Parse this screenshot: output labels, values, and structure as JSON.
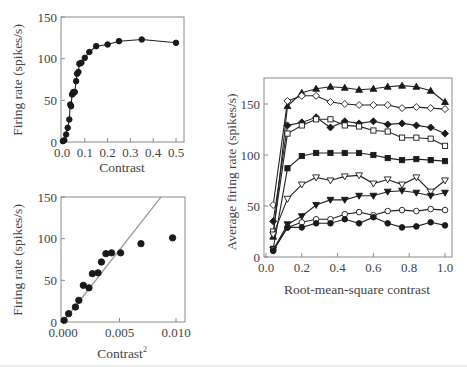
{
  "chart_data": [
    {
      "id": "top-left",
      "type": "line",
      "xlabel": "Contrast",
      "ylabel": "Firing rate (spikes/s)",
      "xlim": [
        0,
        0.53
      ],
      "ylim": [
        0,
        150
      ],
      "xticks": [
        0.0,
        0.1,
        0.2,
        0.3,
        0.4,
        0.5
      ],
      "xtick_labels": [
        "0.0",
        "0.1",
        "0.2",
        "0.3",
        "0.4",
        "0.5"
      ],
      "yticks": [
        0,
        50,
        100,
        150
      ],
      "ytick_labels": [
        "0",
        "50",
        "100",
        "150"
      ],
      "grid": false,
      "series": [
        {
          "name": "response",
          "marker": "filled-circle",
          "x": [
            0.004,
            0.01,
            0.018,
            0.025,
            0.032,
            0.036,
            0.04,
            0.044,
            0.048,
            0.05,
            0.056,
            0.062,
            0.066,
            0.072,
            0.076,
            0.085,
            0.1,
            0.12,
            0.15,
            0.2,
            0.25,
            0.35,
            0.5
          ],
          "y": [
            1,
            2,
            9,
            17,
            27,
            45,
            43,
            57,
            58,
            60,
            60,
            73,
            82,
            84,
            94,
            95,
            101,
            108,
            115,
            117,
            121,
            123,
            119
          ]
        }
      ]
    },
    {
      "id": "bottom-left",
      "type": "scatter",
      "xlabel": "Contrast",
      "xlabel_sup": "2",
      "ylabel": "Firing rate (spikes/s)",
      "xlim": [
        0,
        0.0105
      ],
      "ylim": [
        0,
        150
      ],
      "xticks": [
        0.0,
        0.005,
        0.01
      ],
      "xtick_labels": [
        "0.000",
        "0.005",
        "0.010"
      ],
      "yticks": [
        0,
        50,
        100,
        150
      ],
      "ytick_labels": [
        "0",
        "50",
        "100",
        "150"
      ],
      "grid": false,
      "series": [
        {
          "name": "response",
          "marker": "filled-circle",
          "x": [
            0.0001,
            0.0005,
            0.0011,
            0.0014,
            0.0018,
            0.0023,
            0.0026,
            0.0031,
            0.0034,
            0.0038,
            0.0043,
            0.0051,
            0.0069,
            0.0097
          ],
          "y": [
            2,
            10,
            18,
            26,
            44,
            41,
            58,
            59,
            72,
            82,
            83,
            83,
            94,
            101
          ]
        }
      ],
      "fit_line": {
        "name": "linear fit",
        "slope": 17300,
        "intercept": 0,
        "x_range": [
          0,
          0.00868
        ]
      }
    },
    {
      "id": "right",
      "type": "line",
      "xlabel": "Root-mean-square contrast",
      "ylabel": "Average firing rate (spikes/s)",
      "xlim": [
        0,
        1.02
      ],
      "ylim": [
        0,
        180
      ],
      "xticks": [
        0.0,
        0.2,
        0.4,
        0.6,
        0.8,
        1.0
      ],
      "xtick_labels": [
        "0.0",
        "0.2",
        "0.4",
        "0.6",
        "0.8",
        "1.0"
      ],
      "yticks": [
        0,
        50,
        100,
        150
      ],
      "ytick_labels": [
        "0",
        "50",
        "100",
        "150"
      ],
      "grid": false,
      "x": [
        0.04,
        0.12,
        0.2,
        0.28,
        0.36,
        0.44,
        0.52,
        0.6,
        0.68,
        0.76,
        0.84,
        0.92,
        1.0
      ],
      "series": [
        {
          "name": "filled-triangle-up",
          "marker": "triangle-up",
          "filled": true,
          "values": [
            20,
            148,
            161,
            165,
            167,
            166,
            164,
            165,
            167,
            168,
            167,
            163,
            152
          ]
        },
        {
          "name": "open-diamond",
          "marker": "diamond",
          "filled": false,
          "values": [
            51,
            153,
            158,
            158,
            152,
            150,
            149,
            149,
            149,
            146,
            147,
            146,
            145
          ]
        },
        {
          "name": "filled-diamond",
          "marker": "diamond",
          "filled": true,
          "values": [
            35,
            129,
            132,
            137,
            127,
            133,
            131,
            133,
            130,
            131,
            129,
            127,
            121
          ]
        },
        {
          "name": "open-square",
          "marker": "square",
          "filled": false,
          "values": [
            25,
            121,
            129,
            135,
            135,
            129,
            128,
            124,
            123,
            117,
            117,
            116,
            109
          ]
        },
        {
          "name": "filled-square",
          "marker": "square",
          "filled": true,
          "values": [
            8,
            87,
            99,
            102,
            102,
            102,
            102,
            100,
            97,
            95,
            96,
            95,
            94
          ]
        },
        {
          "name": "open-triangle-down",
          "marker": "triangle-down",
          "filled": false,
          "values": [
            22,
            57,
            71,
            78,
            75,
            79,
            80,
            72,
            76,
            71,
            78,
            64,
            75
          ]
        },
        {
          "name": "filled-triangle-down",
          "marker": "triangle-down",
          "filled": true,
          "values": [
            7,
            32,
            40,
            51,
            56,
            56,
            60,
            60,
            64,
            65,
            63,
            60,
            63
          ]
        },
        {
          "name": "open-circle",
          "marker": "circle",
          "filled": false,
          "values": [
            7,
            29,
            34,
            37,
            37,
            42,
            44,
            41,
            45,
            46,
            45,
            47,
            46
          ]
        },
        {
          "name": "filled-circle",
          "marker": "circle",
          "filled": true,
          "values": [
            6,
            29,
            29,
            33,
            33,
            37,
            33,
            39,
            33,
            29,
            30,
            34,
            31
          ]
        }
      ]
    }
  ]
}
